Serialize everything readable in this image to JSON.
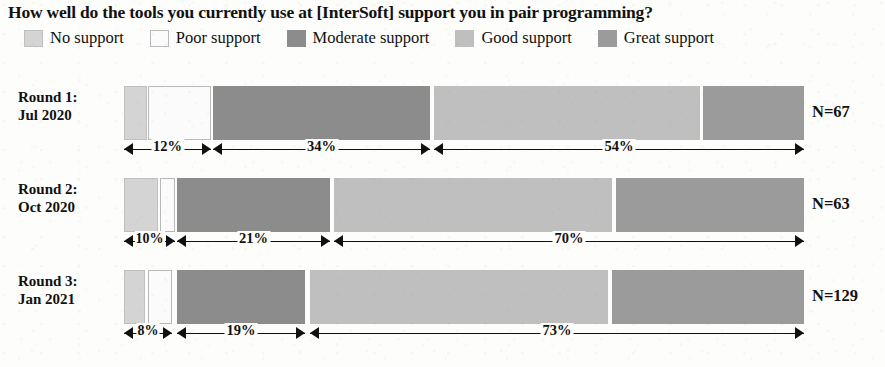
{
  "title": "How well do the tools you currently use at [InterSoft] support you in pair programming?",
  "legend": [
    {
      "label": "No support",
      "color": "#d4d4d4",
      "border": "#c0c0c0",
      "name": "no-support"
    },
    {
      "label": "Poor support",
      "color": "#fbfbfb",
      "border": "#b9b9b9",
      "name": "poor-support"
    },
    {
      "label": "Moderate support",
      "color": "#8c8c8c",
      "border": "#8c8c8c",
      "name": "moderate-support"
    },
    {
      "label": "Good support",
      "color": "#bfbfbf",
      "border": "#bfbfbf",
      "name": "good-support"
    },
    {
      "label": "Great support",
      "color": "#9b9b9b",
      "border": "#9b9b9b",
      "name": "great-support"
    }
  ],
  "rows": [
    {
      "round": "Round 1:",
      "date": "Jul 2020",
      "n_label": "N=67",
      "annotations": [
        {
          "pct": "12%"
        },
        {
          "pct": "34%"
        },
        {
          "pct": "54%"
        }
      ]
    },
    {
      "round": "Round 2:",
      "date": "Oct 2020",
      "n_label": "N=63",
      "annotations": [
        {
          "pct": "10%"
        },
        {
          "pct": "21%"
        },
        {
          "pct": "70%"
        }
      ]
    },
    {
      "round": "Round 3:",
      "date": "Jan 2021",
      "n_label": "N=129",
      "annotations": [
        {
          "pct": "8%"
        },
        {
          "pct": "19%"
        },
        {
          "pct": "73%"
        }
      ]
    }
  ],
  "chart_data": {
    "type": "bar",
    "subtype": "stacked-horizontal-100pct-likert",
    "title": "How well do the tools you currently use at [InterSoft] support you in pair programming?",
    "xlabel": "",
    "ylabel": "",
    "xlim": [
      0,
      100
    ],
    "grid": false,
    "legend_position": "top",
    "categories": [
      "Round 1: Jul 2020",
      "Round 2: Oct 2020",
      "Round 3: Jan 2021"
    ],
    "sample_sizes": [
      67,
      63,
      129
    ],
    "series": [
      {
        "name": "No support",
        "values": [
          3,
          5,
          3
        ]
      },
      {
        "name": "Poor support",
        "values": [
          9,
          5,
          5
        ]
      },
      {
        "name": "Moderate support",
        "values": [
          34,
          21,
          19
        ]
      },
      {
        "name": "Good support",
        "values": [
          39,
          41,
          44
        ]
      },
      {
        "name": "Great support",
        "values": [
          15,
          28,
          29
        ]
      }
    ],
    "annotations": [
      {
        "row": "Round 1: Jul 2020",
        "label": "12%",
        "spans": [
          "No support",
          "Poor support"
        ]
      },
      {
        "row": "Round 1: Jul 2020",
        "label": "34%",
        "spans": [
          "Moderate support"
        ]
      },
      {
        "row": "Round 1: Jul 2020",
        "label": "54%",
        "spans": [
          "Good support",
          "Great support"
        ]
      },
      {
        "row": "Round 2: Oct 2020",
        "label": "10%",
        "spans": [
          "No support",
          "Poor support"
        ]
      },
      {
        "row": "Round 2: Oct 2020",
        "label": "21%",
        "spans": [
          "Moderate support"
        ]
      },
      {
        "row": "Round 2: Oct 2020",
        "label": "70%",
        "spans": [
          "Good support",
          "Great support"
        ]
      },
      {
        "row": "Round 3: Jan 2021",
        "label": "8%",
        "spans": [
          "No support",
          "Poor support"
        ]
      },
      {
        "row": "Round 3: Jan 2021",
        "label": "19%",
        "spans": [
          "Moderate support"
        ]
      },
      {
        "row": "Round 3: Jan 2021",
        "label": "73%",
        "spans": [
          "Good support",
          "Great support"
        ]
      }
    ]
  },
  "geometry": {
    "bar_left": 124,
    "bar_right": 804,
    "rows": [
      {
        "top": 86,
        "label_top": 88,
        "ann_top": 141,
        "segments": [
          {
            "x": 124,
            "w": 23
          },
          {
            "x": 148,
            "w": 63
          },
          {
            "x": 213,
            "w": 217
          },
          {
            "x": 434,
            "w": 266
          },
          {
            "x": 703,
            "w": 101
          }
        ],
        "ann": [
          {
            "x": 124,
            "w": 87
          },
          {
            "x": 213,
            "w": 217
          },
          {
            "x": 434,
            "w": 370
          }
        ]
      },
      {
        "top": 178,
        "label_top": 180,
        "ann_top": 233,
        "segments": [
          {
            "x": 124,
            "w": 34
          },
          {
            "x": 160,
            "w": 15
          },
          {
            "x": 177,
            "w": 153
          },
          {
            "x": 334,
            "w": 278
          },
          {
            "x": 616,
            "w": 188
          }
        ],
        "ann": [
          {
            "x": 124,
            "w": 51
          },
          {
            "x": 177,
            "w": 153
          },
          {
            "x": 334,
            "w": 470
          }
        ]
      },
      {
        "top": 270,
        "label_top": 272,
        "ann_top": 325,
        "segments": [
          {
            "x": 124,
            "w": 21
          },
          {
            "x": 148,
            "w": 24
          },
          {
            "x": 177,
            "w": 128
          },
          {
            "x": 310,
            "w": 298
          },
          {
            "x": 612,
            "w": 192
          }
        ],
        "ann": [
          {
            "x": 124,
            "w": 48
          },
          {
            "x": 177,
            "w": 128
          },
          {
            "x": 310,
            "w": 494
          }
        ]
      }
    ]
  }
}
